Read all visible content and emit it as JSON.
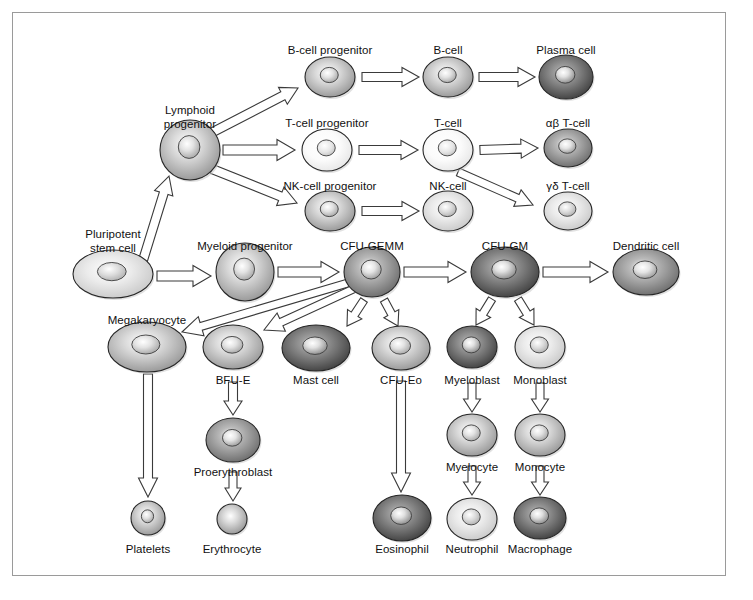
{
  "figure": {
    "frame_color": "#9a9a9a",
    "background": "#ffffff",
    "arrow_outline_color": "#3a3a3a"
  },
  "caption": {
    "text": ""
  },
  "cells": [
    {
      "id": "pluripotent-stem-cell",
      "label": "Pluripotent\nstem cell",
      "cx": 113,
      "cy": 274,
      "rx": 40,
      "ry": 24,
      "shade": "light",
      "label_x": 113,
      "label_y": 228,
      "label_align": "left-ish"
    },
    {
      "id": "lymphoid-progenitor",
      "label": "Lymphoid\nprogenitor",
      "cx": 190,
      "cy": 150,
      "rx": 30,
      "ry": 30,
      "shade": "mid",
      "label_x": 190,
      "label_y": 104
    },
    {
      "id": "myeloid-progenitor",
      "label": "Myeloid progenitor",
      "cx": 245,
      "cy": 272,
      "rx": 29,
      "ry": 29,
      "shade": "mid",
      "label_x": 245,
      "label_y": 240
    },
    {
      "id": "b-cell-progenitor",
      "label": "B-cell progenitor",
      "cx": 330,
      "cy": 77,
      "rx": 25,
      "ry": 20,
      "shade": "mid",
      "label_x": 330,
      "label_y": 44
    },
    {
      "id": "b-cell",
      "label": "B-cell",
      "cx": 448,
      "cy": 77,
      "rx": 25,
      "ry": 20,
      "shade": "mid",
      "label_x": 448,
      "label_y": 44
    },
    {
      "id": "plasma-cell",
      "label": "Plasma cell",
      "cx": 566,
      "cy": 77,
      "rx": 27,
      "ry": 22,
      "shade": "dark",
      "label_x": 566,
      "label_y": 44
    },
    {
      "id": "t-cell-progenitor",
      "label": "T-cell progenitor",
      "cx": 327,
      "cy": 150,
      "rx": 25,
      "ry": 21,
      "shade": "verylight",
      "label_x": 327,
      "label_y": 117
    },
    {
      "id": "t-cell",
      "label": "T-cell",
      "cx": 448,
      "cy": 150,
      "rx": 25,
      "ry": 21,
      "shade": "verylight",
      "label_x": 448,
      "label_y": 117
    },
    {
      "id": "alpha-beta-t-cell",
      "label": "αβ T-cell",
      "cx": 568,
      "cy": 148,
      "rx": 24,
      "ry": 19,
      "shade": "darkmid",
      "label_x": 568,
      "label_y": 117
    },
    {
      "id": "nk-cell-progenitor",
      "label": "NK-cell progenitor",
      "cx": 330,
      "cy": 211,
      "rx": 25,
      "ry": 20,
      "shade": "mid",
      "label_x": 330,
      "label_y": 180
    },
    {
      "id": "nk-cell",
      "label": "NK-cell",
      "cx": 448,
      "cy": 211,
      "rx": 25,
      "ry": 20,
      "shade": "light",
      "label_x": 448,
      "label_y": 180
    },
    {
      "id": "gamma-delta-t-cell",
      "label": "γδ T-cell",
      "cx": 568,
      "cy": 211,
      "rx": 24,
      "ry": 19,
      "shade": "light",
      "label_x": 568,
      "label_y": 180
    },
    {
      "id": "cfu-gemm",
      "label": "CFU-GEMM",
      "cx": 372,
      "cy": 272,
      "rx": 28,
      "ry": 25,
      "shade": "darkmid",
      "label_x": 372,
      "label_y": 240
    },
    {
      "id": "cfu-gm",
      "label": "CFU-GM",
      "cx": 505,
      "cy": 272,
      "rx": 34,
      "ry": 25,
      "shade": "dark",
      "label_x": 505,
      "label_y": 240
    },
    {
      "id": "dendritic-cell",
      "label": "Dendritic cell",
      "cx": 646,
      "cy": 272,
      "rx": 33,
      "ry": 23,
      "shade": "darkmid",
      "label_x": 646,
      "label_y": 240
    },
    {
      "id": "megakaryocyte",
      "label": "Megakaryocyte",
      "cx": 147,
      "cy": 347,
      "rx": 39,
      "ry": 25,
      "shade": "mid",
      "label_x": 147,
      "label_y": 314
    },
    {
      "id": "bfu-e",
      "label": "BFU-E",
      "cx": 233,
      "cy": 347,
      "rx": 30,
      "ry": 22,
      "shade": "mid",
      "label_x": 233,
      "label_y": 374
    },
    {
      "id": "mast-cell",
      "label": "Mast cell",
      "cx": 316,
      "cy": 348,
      "rx": 34,
      "ry": 23,
      "shade": "dark",
      "label_x": 316,
      "label_y": 374
    },
    {
      "id": "cfu-eo",
      "label": "CFU-Eo",
      "cx": 401,
      "cy": 348,
      "rx": 29,
      "ry": 22,
      "shade": "mid",
      "label_x": 401,
      "label_y": 374
    },
    {
      "id": "myeloblast",
      "label": "Myeloblast",
      "cx": 472,
      "cy": 347,
      "rx": 25,
      "ry": 21,
      "shade": "dark",
      "label_x": 472,
      "label_y": 374
    },
    {
      "id": "monoblast",
      "label": "Monoblast",
      "cx": 540,
      "cy": 347,
      "rx": 25,
      "ry": 21,
      "shade": "light",
      "label_x": 540,
      "label_y": 374
    },
    {
      "id": "proerythroblast",
      "label": "Proerythroblast",
      "cx": 233,
      "cy": 440,
      "rx": 27,
      "ry": 22,
      "shade": "darkmid",
      "label_x": 233,
      "label_y": 466
    },
    {
      "id": "myelocyte",
      "label": "Myelocyte",
      "cx": 472,
      "cy": 435,
      "rx": 25,
      "ry": 21,
      "shade": "mid",
      "label_x": 472,
      "label_y": 461
    },
    {
      "id": "monocyte",
      "label": "Monocyte",
      "cx": 540,
      "cy": 435,
      "rx": 25,
      "ry": 21,
      "shade": "mid",
      "label_x": 540,
      "label_y": 461
    },
    {
      "id": "platelets",
      "label": "Platelets",
      "cx": 148,
      "cy": 518,
      "rx": 17,
      "ry": 17,
      "shade": "mid",
      "label_x": 148,
      "label_y": 543
    },
    {
      "id": "erythrocyte",
      "label": "Erythrocyte",
      "cx": 232,
      "cy": 519,
      "rx": 15,
      "ry": 15,
      "shade": "mid",
      "label_x": 232,
      "label_y": 543
    },
    {
      "id": "eosinophil",
      "label": "Eosinophil",
      "cx": 402,
      "cy": 518,
      "rx": 29,
      "ry": 23,
      "shade": "dark",
      "label_x": 402,
      "label_y": 543
    },
    {
      "id": "neutrophil",
      "label": "Neutrophil",
      "cx": 472,
      "cy": 519,
      "rx": 25,
      "ry": 21,
      "shade": "light",
      "label_x": 472,
      "label_y": 543
    },
    {
      "id": "macrophage",
      "label": "Macrophage",
      "cx": 540,
      "cy": 518,
      "rx": 26,
      "ry": 21,
      "shade": "dark",
      "label_x": 540,
      "label_y": 543
    }
  ],
  "arrows": [
    {
      "id": "stem-to-lymphoid",
      "from": "pluripotent-stem-cell",
      "to": "lymphoid-progenitor",
      "style": "long-diagonal"
    },
    {
      "id": "stem-to-myeloid",
      "from": "pluripotent-stem-cell",
      "to": "myeloid-progenitor",
      "style": "horizontal"
    },
    {
      "id": "lymphoid-to-b-progenitor",
      "from": "lymphoid-progenitor",
      "to": "b-cell-progenitor",
      "style": "diagonal-up"
    },
    {
      "id": "lymphoid-to-t-progenitor",
      "from": "lymphoid-progenitor",
      "to": "t-cell-progenitor",
      "style": "horizontal"
    },
    {
      "id": "lymphoid-to-nk-progenitor",
      "from": "lymphoid-progenitor",
      "to": "nk-cell-progenitor",
      "style": "diagonal-down"
    },
    {
      "id": "b-progenitor-to-b-cell",
      "from": "b-cell-progenitor",
      "to": "b-cell",
      "style": "horizontal"
    },
    {
      "id": "b-cell-to-plasma",
      "from": "b-cell",
      "to": "plasma-cell",
      "style": "horizontal"
    },
    {
      "id": "t-progenitor-to-t-cell",
      "from": "t-cell-progenitor",
      "to": "t-cell",
      "style": "horizontal"
    },
    {
      "id": "t-cell-to-ab-t-cell",
      "from": "t-cell",
      "to": "alpha-beta-t-cell",
      "style": "horizontal"
    },
    {
      "id": "t-cell-to-gd-t-cell",
      "from": "t-cell",
      "to": "gamma-delta-t-cell",
      "style": "diagonal-down"
    },
    {
      "id": "nk-progenitor-to-nk-cell",
      "from": "nk-cell-progenitor",
      "to": "nk-cell",
      "style": "horizontal"
    },
    {
      "id": "myeloid-to-cfu-gemm",
      "from": "myeloid-progenitor",
      "to": "cfu-gemm",
      "style": "horizontal"
    },
    {
      "id": "cfu-gemm-to-cfu-gm",
      "from": "cfu-gemm",
      "to": "cfu-gm",
      "style": "horizontal"
    },
    {
      "id": "cfu-gm-to-dendritic",
      "from": "cfu-gm",
      "to": "dendritic-cell",
      "style": "horizontal"
    },
    {
      "id": "cfu-gemm-to-megakaryocyte",
      "from": "cfu-gemm",
      "to": "megakaryocyte",
      "style": "long-diagonal-left"
    },
    {
      "id": "cfu-gemm-to-bfu-e",
      "from": "cfu-gemm",
      "to": "bfu-e",
      "style": "long-diagonal-left"
    },
    {
      "id": "cfu-gemm-to-mast-cell",
      "from": "cfu-gemm",
      "to": "mast-cell",
      "style": "short-down-left"
    },
    {
      "id": "cfu-gemm-to-cfu-eo",
      "from": "cfu-gemm",
      "to": "cfu-eo",
      "style": "short-down-right"
    },
    {
      "id": "cfu-gm-to-myeloblast",
      "from": "cfu-gm",
      "to": "myeloblast",
      "style": "short-down-left"
    },
    {
      "id": "cfu-gm-to-monoblast",
      "from": "cfu-gm",
      "to": "monoblast",
      "style": "short-down-right"
    },
    {
      "id": "megakaryocyte-to-platelets",
      "from": "megakaryocyte",
      "to": "platelets",
      "style": "long-vertical"
    },
    {
      "id": "bfu-e-to-proerythroblast",
      "from": "bfu-e",
      "to": "proerythroblast",
      "style": "vertical"
    },
    {
      "id": "proerythroblast-to-erythrocyte",
      "from": "proerythroblast",
      "to": "erythrocyte",
      "style": "vertical"
    },
    {
      "id": "cfu-eo-to-eosinophil",
      "from": "cfu-eo",
      "to": "eosinophil",
      "style": "long-vertical"
    },
    {
      "id": "myeloblast-to-myelocyte",
      "from": "myeloblast",
      "to": "myelocyte",
      "style": "vertical"
    },
    {
      "id": "myelocyte-to-neutrophil",
      "from": "myelocyte",
      "to": "neutrophil",
      "style": "vertical"
    },
    {
      "id": "monoblast-to-monocyte",
      "from": "monoblast",
      "to": "monocyte",
      "style": "vertical"
    },
    {
      "id": "monocyte-to-macrophage",
      "from": "monocyte",
      "to": "macrophage",
      "style": "vertical"
    }
  ]
}
